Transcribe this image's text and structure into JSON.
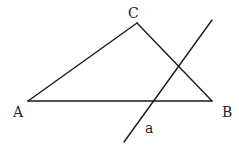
{
  "diagram": {
    "type": "geometry",
    "stroke_color": "#1a1a1a",
    "points": {
      "A": {
        "label": "A",
        "x": 28,
        "y": 101,
        "label_x": 13,
        "label_y": 117
      },
      "B": {
        "label": "B",
        "x": 212,
        "y": 101,
        "label_x": 222,
        "label_y": 117
      },
      "C": {
        "label": "C",
        "x": 137,
        "y": 23,
        "label_x": 128,
        "label_y": 18
      }
    },
    "segments": [
      {
        "name": "AB",
        "from": "A",
        "to": "B"
      },
      {
        "name": "BC",
        "from": "B",
        "to": "C"
      },
      {
        "name": "CA",
        "from": "C",
        "to": "A"
      }
    ],
    "line_a": {
      "label": "a",
      "x1": 212,
      "y1": 20,
      "x2": 124,
      "y2": 142,
      "label_x": 145,
      "label_y": 133
    }
  }
}
